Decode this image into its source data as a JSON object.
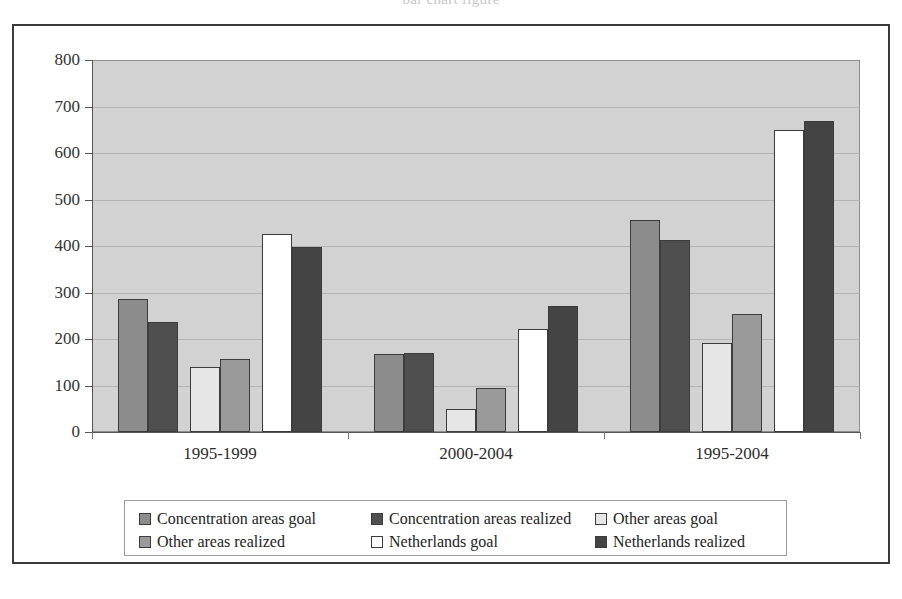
{
  "title": {
    "text": "bar chart figure"
  },
  "chart_data": {
    "type": "bar",
    "title": "",
    "subtitle": "",
    "xlabel": "",
    "ylabel": "",
    "ylim": [
      0,
      800
    ],
    "ytick_step": 100,
    "yticks": [
      "800",
      "700",
      "600",
      "500",
      "400",
      "300",
      "200",
      "100",
      "0"
    ],
    "grid": true,
    "legend_position": "bottom",
    "categories": [
      "1995-1999",
      "2000-2004",
      "1995-2004"
    ],
    "series": [
      {
        "name": "Concentration areas goal",
        "color": "#8c8c8c",
        "values": [
          285,
          168,
          455
        ]
      },
      {
        "name": "Concentration areas realized",
        "color": "#4f4f4f",
        "values": [
          237,
          170,
          412
        ]
      },
      {
        "name": "Other areas goal",
        "color": "#e6e6e6",
        "values": [
          140,
          50,
          191
        ]
      },
      {
        "name": "Other areas realized",
        "color": "#9a9a9a",
        "values": [
          157,
          95,
          253
        ]
      },
      {
        "name": "Netherlands goal",
        "color": "#ffffff",
        "values": [
          425,
          222,
          650
        ]
      },
      {
        "name": "Netherlands realized",
        "color": "#444444",
        "values": [
          398,
          272,
          668
        ]
      }
    ],
    "plot_background": "#d2d2d2",
    "frame_color": "#3a3a3a"
  },
  "legend": {
    "items": [
      {
        "label": "Concentration areas goal"
      },
      {
        "label": "Concentration areas realized"
      },
      {
        "label": "Other areas goal"
      },
      {
        "label": "Other areas realized"
      },
      {
        "label": "Netherlands goal"
      },
      {
        "label": "Netherlands realized"
      }
    ]
  }
}
